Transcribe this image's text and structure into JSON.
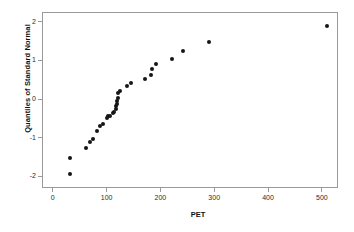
{
  "chart_data": {
    "type": "scatter",
    "title": "",
    "subtitle": "",
    "xlabel": "PET",
    "ylabel": "Quantiles of Standard Normal",
    "xlim": [
      -20,
      530
    ],
    "ylim": [
      -2.3,
      2.25
    ],
    "xticks": [
      0,
      100,
      200,
      300,
      400,
      500
    ],
    "yticks": [
      2,
      1,
      0,
      -1,
      -2
    ],
    "grid": false,
    "legend": null,
    "marker": {
      "shape": "circle",
      "color": "#161616",
      "size": 4
    },
    "frame_color": "#9a9a9a",
    "background": "#ffffff",
    "points": [
      {
        "x": 30,
        "y": -1.92
      },
      {
        "x": 30,
        "y": -1.49
      },
      {
        "x": 60,
        "y": -1.25
      },
      {
        "x": 68,
        "y": -1.09
      },
      {
        "x": 72,
        "y": -1.0
      },
      {
        "x": 80,
        "y": -0.79
      },
      {
        "x": 86,
        "y": -0.68
      },
      {
        "x": 92,
        "y": -0.62
      },
      {
        "x": 98,
        "y": -0.46
      },
      {
        "x": 101,
        "y": -0.42
      },
      {
        "x": 104,
        "y": -0.41
      },
      {
        "x": 110,
        "y": -0.34
      },
      {
        "x": 112,
        "y": -0.32
      },
      {
        "x": 115,
        "y": -0.23
      },
      {
        "x": 116,
        "y": -0.16
      },
      {
        "x": 117,
        "y": -0.1
      },
      {
        "x": 118,
        "y": -0.03
      },
      {
        "x": 119,
        "y": 0.06
      },
      {
        "x": 120,
        "y": 0.17
      },
      {
        "x": 124,
        "y": 0.23
      },
      {
        "x": 136,
        "y": 0.36
      },
      {
        "x": 143,
        "y": 0.43
      },
      {
        "x": 170,
        "y": 0.54
      },
      {
        "x": 180,
        "y": 0.65
      },
      {
        "x": 183,
        "y": 0.79
      },
      {
        "x": 190,
        "y": 0.92
      },
      {
        "x": 220,
        "y": 1.07
      },
      {
        "x": 241,
        "y": 1.26
      },
      {
        "x": 289,
        "y": 1.51
      },
      {
        "x": 508,
        "y": 1.92
      }
    ]
  }
}
